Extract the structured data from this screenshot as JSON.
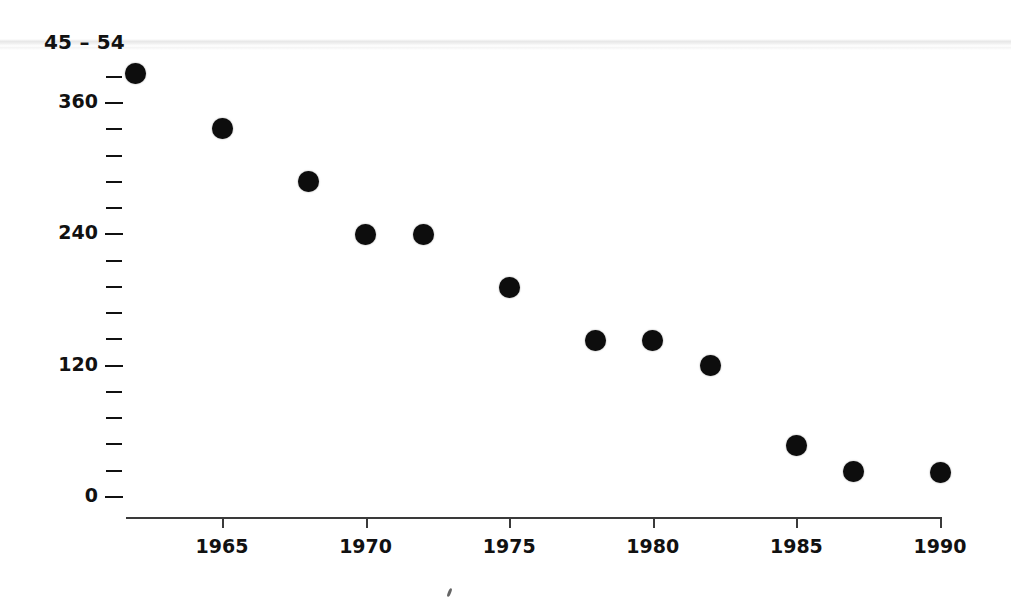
{
  "chart_data": {
    "type": "scatter",
    "title": "45 – 54",
    "xlabel": "",
    "ylabel": "",
    "x": [
      1962,
      1965,
      1968,
      1970,
      1972,
      1975,
      1978,
      1980,
      1982,
      1985,
      1987,
      1990
    ],
    "values": [
      387,
      337,
      288,
      240,
      240,
      191,
      143,
      143,
      120,
      47,
      23,
      22
    ],
    "points": [
      {
        "x": 1962,
        "y": 387
      },
      {
        "x": 1965,
        "y": 337
      },
      {
        "x": 1968,
        "y": 288
      },
      {
        "x": 1970,
        "y": 240
      },
      {
        "x": 1972,
        "y": 240
      },
      {
        "x": 1975,
        "y": 191
      },
      {
        "x": 1978,
        "y": 143
      },
      {
        "x": 1980,
        "y": 143
      },
      {
        "x": 1982,
        "y": 120
      },
      {
        "x": 1985,
        "y": 47
      },
      {
        "x": 1987,
        "y": 23
      },
      {
        "x": 1990,
        "y": 22
      }
    ],
    "xlim": [
      1961,
      1991
    ],
    "ylim": [
      0,
      400
    ],
    "x_ticks": [
      1965,
      1970,
      1975,
      1980,
      1985,
      1990
    ],
    "x_tick_labels": [
      "1965",
      "1970",
      "1975",
      "1980",
      "1985",
      "1990"
    ],
    "y_ticks": [
      0,
      24,
      48,
      72,
      96,
      120,
      144,
      168,
      192,
      216,
      240,
      264,
      288,
      312,
      336,
      360,
      384
    ],
    "y_major_ticks": [
      0,
      120,
      240,
      360
    ],
    "y_tick_labels": [
      "0",
      "120",
      "240",
      "360"
    ],
    "grid": false,
    "legend": null,
    "marker": {
      "shape": "circle",
      "color": "#0d0d0d",
      "size": 21
    },
    "axis_color": "#3a3a3a"
  },
  "artifacts": {
    "scan_streak": "horizontal-scan-line",
    "speck": "ink-speck"
  }
}
